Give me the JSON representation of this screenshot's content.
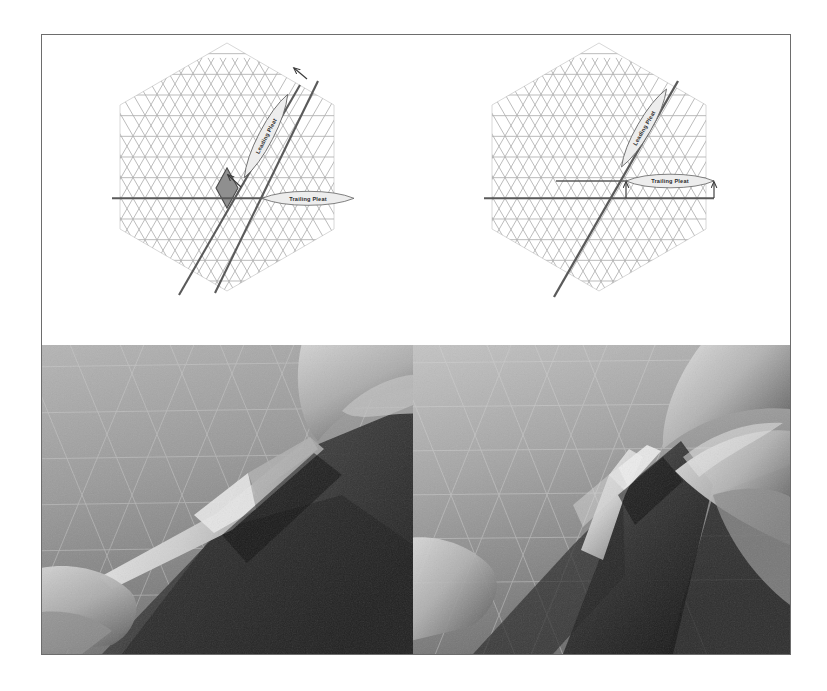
{
  "figure": {
    "panel_count": 4,
    "frame_color": "#6d6d6d",
    "background_color": "#ffffff"
  },
  "palette": {
    "grid_line": "#b9b9b9",
    "grid_line_strong": "#a3a3a3",
    "fold_line": "#5a5a5a",
    "hex_outline": "#d0d0d0",
    "callout_fill": "#ededed",
    "callout_stroke": "#6a6a6a",
    "rhombus_fill": "#8f8f8f",
    "rhombus_stroke": "#4a4a4a",
    "arrow_color": "#3a3a3a",
    "label_text": "#2b2b2b",
    "photo_paper_light": "#c9c9c9",
    "photo_paper_mid": "#9a9a9a",
    "photo_shadow": "#3a3a3a",
    "photo_dark": "#1d1d1d",
    "skin_light": "#cfcfcf",
    "skin_mid": "#a6a6a6"
  },
  "panels": [
    {
      "id": "diagram-before",
      "position": "top-left",
      "kind": "crease-pattern",
      "shape": "hexagon",
      "grid": "triangular",
      "has_shaded_rhombus": true,
      "labels": [
        {
          "name": "leading-pleat",
          "text": "Leading Pleat",
          "rotation_deg": 62,
          "shape": "lens"
        },
        {
          "name": "trailing-pleat",
          "text": "Trailing Pleat",
          "rotation_deg": 0,
          "shape": "lens"
        }
      ],
      "arrows": [
        {
          "name": "leading-pleat-arrow-upper",
          "direction": "up-left"
        },
        {
          "name": "leading-pleat-arrow-lower",
          "direction": "up-left"
        }
      ],
      "fold_lines": [
        {
          "name": "horizontal-trailing-crease",
          "orientation": "horizontal"
        },
        {
          "name": "diagonal-crease-a",
          "orientation": "diagonal-60"
        },
        {
          "name": "diagonal-crease-b",
          "orientation": "diagonal-60"
        }
      ]
    },
    {
      "id": "diagram-after",
      "position": "top-right",
      "kind": "crease-pattern",
      "shape": "hexagon",
      "grid": "triangular",
      "has_shaded_rhombus": false,
      "labels": [
        {
          "name": "leading-pleat",
          "text": "Leading Pleat",
          "rotation_deg": 62,
          "shape": "lens"
        },
        {
          "name": "trailing-pleat",
          "text": "Trailing Pleat",
          "rotation_deg": 0,
          "shape": "lens"
        }
      ],
      "arrows": [
        {
          "name": "trailing-pleat-arrow-left",
          "direction": "up"
        },
        {
          "name": "trailing-pleat-arrow-right",
          "direction": "up"
        }
      ],
      "fold_lines": [
        {
          "name": "horizontal-trailing-crease",
          "orientation": "horizontal"
        },
        {
          "name": "horizontal-offset-crease",
          "orientation": "horizontal"
        },
        {
          "name": "diagonal-crease-merged",
          "orientation": "diagonal-60"
        }
      ]
    },
    {
      "id": "photo-before",
      "position": "bottom-left",
      "kind": "photograph",
      "subject": "hands pinching a pleat in triangle-gridded paper",
      "color_mode": "grayscale"
    },
    {
      "id": "photo-after",
      "position": "bottom-right",
      "kind": "photograph",
      "subject": "fingers collapsing the pleat flat against the sheet",
      "color_mode": "grayscale"
    }
  ],
  "callouts": {
    "leading_pleat": "Leading Pleat",
    "trailing_pleat": "Trailing Pleat"
  }
}
